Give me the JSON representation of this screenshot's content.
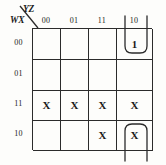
{
  "diagram": {
    "type": "karnaugh-map",
    "column_axis_label": "YZ",
    "row_axis_label": "WX",
    "column_headers": [
      "00",
      "01",
      "11",
      "10"
    ],
    "row_headers": [
      "00",
      "01",
      "11",
      "10"
    ],
    "cells": [
      [
        "",
        "",
        "",
        "1"
      ],
      [
        "",
        "",
        "",
        ""
      ],
      [
        "X",
        "X",
        "X",
        "X"
      ],
      [
        "",
        "",
        "X",
        "X"
      ]
    ],
    "groups": [
      {
        "name": "wrap-around-group-top",
        "shape": "u-open-upward",
        "cells": "row 00 / column 10"
      },
      {
        "name": "wrap-around-group-bottom",
        "shape": "u-open-downward",
        "cells": "row 10 / column 10"
      }
    ],
    "colors": {
      "line": "#2b2b2b",
      "background": "#fdfdfb",
      "text": "#1a1a1a"
    }
  }
}
